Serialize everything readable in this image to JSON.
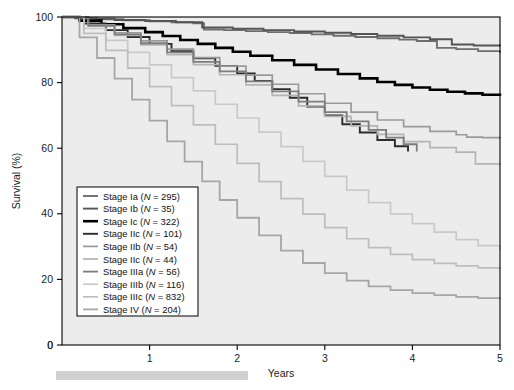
{
  "figure": {
    "background": "#ffffff",
    "plot_background": "#ececec",
    "axis_color": "#000000"
  },
  "axes": {
    "y_label": "Survival (%)",
    "x_label": "Years",
    "y_ticks": [
      "0",
      "20",
      "40",
      "60",
      "80",
      "100"
    ],
    "x_ticks": [
      "1",
      "2",
      "3",
      "4",
      "5"
    ],
    "x_origin_label": "0"
  },
  "legend": {
    "box_border": "#000000",
    "box_fill": "#ffffff",
    "entries": [
      {
        "label": "Stage Ia",
        "n": "295",
        "text": "Stage Ia (N = 295)",
        "color": "#6e6e6e",
        "width": 1.9
      },
      {
        "label": "Stage Ib",
        "n": "35",
        "text": "Stage Ib (N = 35)",
        "color": "#555555",
        "width": 1.9
      },
      {
        "label": "Stage Ic",
        "n": "322",
        "text": "Stage Ic (N = 322)",
        "color": "#000000",
        "width": 2.6
      },
      {
        "label": "Stage IIc",
        "n": "101",
        "text": "Stage IIc (N = 101)",
        "color": "#2b2b2b",
        "width": 1.9
      },
      {
        "label": "Stage IIb",
        "n": "54",
        "text": "Stage IIb (N = 54)",
        "color": "#9a9a9a",
        "width": 1.7
      },
      {
        "label": "Stage IIc",
        "n": "44",
        "text": "Stage IIc (N = 44)",
        "color": "#b4b4b4",
        "width": 1.7
      },
      {
        "label": "Stage IIIa",
        "n": "56",
        "text": "Stage IIIa (N = 56)",
        "color": "#7d7d7d",
        "width": 1.8
      },
      {
        "label": "Stage IIIb",
        "n": "116",
        "text": "Stage IIIb (N = 116)",
        "color": "#c9c9c9",
        "width": 1.7
      },
      {
        "label": "Stage IIIc",
        "n": "832",
        "text": "Stage IIIc (N = 832)",
        "color": "#bdbdbd",
        "width": 1.7
      },
      {
        "label": "Stage IV",
        "n": "204",
        "text": "Stage IV (N = 204)",
        "color": "#a6a6a6",
        "width": 1.8
      }
    ]
  },
  "chart_data": {
    "type": "line",
    "title": "",
    "xlabel": "Years",
    "ylabel": "Survival (%)",
    "xlim": [
      0,
      5
    ],
    "ylim": [
      0,
      100
    ],
    "grid": false,
    "legend_position": "lower-left",
    "step": "post",
    "series": [
      {
        "name": "Stage Ia",
        "n": 295,
        "color": "#6e6e6e",
        "final_survival": 89,
        "x": [
          0,
          0.15,
          0.4,
          0.7,
          1.0,
          1.25,
          1.5,
          1.62,
          1.62,
          1.85,
          2.1,
          2.35,
          2.6,
          2.85,
          3.1,
          3.35,
          3.6,
          3.85,
          4.05,
          4.28,
          4.28,
          4.5,
          4.75,
          5.0
        ],
        "y": [
          100,
          99.6,
          99.3,
          99.0,
          98.7,
          98.4,
          98.1,
          98.1,
          96.2,
          96.0,
          95.7,
          95.4,
          95.1,
          94.7,
          94.3,
          93.9,
          93.5,
          93.1,
          92.7,
          92.4,
          90.6,
          90.2,
          89.6,
          89.0
        ]
      },
      {
        "name": "Stage Ib",
        "n": 35,
        "color": "#555555",
        "final_survival": 91,
        "x": [
          0,
          0.3,
          0.6,
          0.95,
          1.3,
          1.6,
          1.6,
          1.95,
          2.3,
          2.65,
          3.0,
          3.3,
          3.6,
          3.9,
          4.2,
          4.45,
          4.45,
          4.7,
          5.0
        ],
        "y": [
          100,
          99.5,
          99.1,
          98.8,
          98.4,
          98.4,
          96.8,
          96.4,
          96.0,
          95.6,
          95.2,
          94.8,
          94.3,
          93.8,
          93.2,
          93.2,
          91.6,
          91.3,
          91.0
        ]
      },
      {
        "name": "Stage Ic",
        "n": 322,
        "color": "#000000",
        "final_survival": 76,
        "x": [
          0,
          0.2,
          0.45,
          0.7,
          0.95,
          1.15,
          1.35,
          1.55,
          1.75,
          1.95,
          2.15,
          2.4,
          2.65,
          2.9,
          3.15,
          3.4,
          3.6,
          3.8,
          4.0,
          4.2,
          4.4,
          4.6,
          4.8,
          5.0
        ],
        "y": [
          100,
          98.9,
          97.8,
          96.6,
          95.4,
          94.2,
          93.0,
          91.8,
          90.6,
          89.4,
          88.2,
          86.8,
          85.4,
          84.0,
          82.6,
          81.3,
          80.2,
          79.3,
          78.5,
          77.8,
          77.2,
          76.7,
          76.3,
          76.0
        ]
      },
      {
        "name": "Stage IIc",
        "n": 101,
        "color": "#2b2b2b",
        "final_survival": 59,
        "x": [
          0,
          0.25,
          0.5,
          0.75,
          1.0,
          1.25,
          1.5,
          1.75,
          2.0,
          2.2,
          2.4,
          2.6,
          2.8,
          3.0,
          3.2,
          3.4,
          3.6,
          3.8,
          3.95,
          3.95
        ],
        "y": [
          100,
          98.0,
          96.0,
          93.9,
          91.8,
          89.6,
          87.4,
          85.1,
          82.8,
          80.5,
          78.0,
          75.4,
          72.7,
          70.0,
          67.3,
          64.8,
          62.5,
          60.6,
          59.4,
          59.0
        ]
      },
      {
        "name": "Stage IIb",
        "n": 54,
        "color": "#9a9a9a",
        "final_survival": 63,
        "x": [
          0,
          0.3,
          0.6,
          0.9,
          1.2,
          1.5,
          1.8,
          2.1,
          2.4,
          2.7,
          3.0,
          3.3,
          3.6,
          3.9,
          4.2,
          4.5,
          4.62,
          4.62,
          4.8,
          5.0
        ],
        "y": [
          100,
          97.6,
          95.2,
          92.7,
          90.2,
          87.6,
          85.0,
          82.3,
          79.5,
          76.6,
          73.7,
          71.0,
          68.6,
          66.6,
          65.1,
          64.1,
          64.1,
          63.4,
          63.2,
          63.0
        ]
      },
      {
        "name": "Stage IIc",
        "n": 44,
        "color": "#b4b4b4",
        "final_survival": 55,
        "x": [
          0,
          0.3,
          0.6,
          0.9,
          1.2,
          1.5,
          1.8,
          2.1,
          2.4,
          2.7,
          3.0,
          3.3,
          3.6,
          3.9,
          4.2,
          4.5,
          4.72,
          4.72,
          5.0
        ],
        "y": [
          100,
          97.2,
          94.4,
          91.5,
          88.5,
          85.5,
          82.4,
          79.3,
          76.1,
          72.9,
          69.7,
          66.8,
          64.2,
          62.0,
          60.2,
          58.8,
          58.8,
          55.2,
          55.0
        ]
      },
      {
        "name": "Stage IIIa",
        "n": 56,
        "color": "#7d7d7d",
        "final_survival": 59,
        "x": [
          0,
          0.3,
          0.6,
          0.9,
          1.2,
          1.5,
          1.8,
          2.1,
          2.4,
          2.7,
          3.0,
          3.25,
          3.5,
          3.7,
          3.9,
          4.05,
          4.05
        ],
        "y": [
          100,
          97.4,
          94.7,
          92.0,
          89.2,
          86.3,
          83.4,
          80.4,
          77.3,
          74.2,
          71.0,
          68.2,
          65.6,
          63.2,
          61.2,
          59.8,
          59.0
        ]
      },
      {
        "name": "Stage IIIb",
        "n": 116,
        "color": "#c9c9c9",
        "final_survival": 29,
        "x": [
          0,
          0.25,
          0.5,
          0.75,
          1.0,
          1.25,
          1.5,
          1.75,
          2.0,
          2.25,
          2.5,
          2.75,
          3.0,
          3.25,
          3.5,
          3.75,
          4.0,
          4.25,
          4.5,
          4.75,
          5.0
        ],
        "y": [
          100,
          96.5,
          92.9,
          89.2,
          85.4,
          81.5,
          77.5,
          73.4,
          69.2,
          64.9,
          60.5,
          56.0,
          51.4,
          47.2,
          43.4,
          40.0,
          37.0,
          34.4,
          32.1,
          30.3,
          29.0
        ]
      },
      {
        "name": "Stage IIIc",
        "n": 832,
        "color": "#bdbdbd",
        "final_survival": 23,
        "x": [
          0,
          0.25,
          0.5,
          0.75,
          1.0,
          1.25,
          1.5,
          1.75,
          2.0,
          2.25,
          2.5,
          2.75,
          3.0,
          3.25,
          3.5,
          3.75,
          4.0,
          4.25,
          4.5,
          4.75,
          5.0
        ],
        "y": [
          100,
          95.0,
          89.8,
          84.4,
          78.8,
          73.0,
          67.1,
          61.2,
          55.4,
          49.8,
          44.6,
          39.9,
          35.8,
          32.4,
          29.7,
          27.6,
          26.0,
          24.9,
          24.1,
          23.5,
          23.0
        ]
      },
      {
        "name": "Stage IV",
        "n": 204,
        "color": "#a6a6a6",
        "final_survival": 14,
        "x": [
          0,
          0.2,
          0.4,
          0.6,
          0.8,
          1.0,
          1.2,
          1.4,
          1.6,
          1.8,
          2.0,
          2.25,
          2.5,
          2.75,
          3.0,
          3.25,
          3.5,
          3.75,
          4.0,
          4.25,
          4.5,
          4.75,
          5.0
        ],
        "y": [
          100,
          93.8,
          87.5,
          81.2,
          74.8,
          68.4,
          62.1,
          55.9,
          49.9,
          44.2,
          38.8,
          33.4,
          28.8,
          25.0,
          21.9,
          19.6,
          17.9,
          16.7,
          15.8,
          15.2,
          14.7,
          14.3,
          14.0
        ]
      }
    ]
  }
}
